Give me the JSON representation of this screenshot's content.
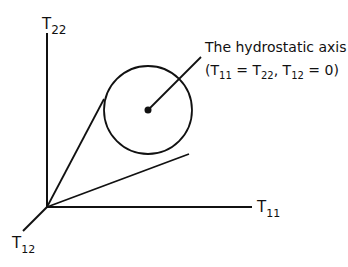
{
  "diagram": {
    "axes": {
      "t22": {
        "base": "T",
        "sub": "22"
      },
      "t11": {
        "base": "T",
        "sub": "11"
      },
      "t12": {
        "base": "T",
        "sub": "12"
      }
    },
    "annotation": {
      "title": "The hydrostatic axis",
      "open": "(",
      "t11": {
        "base": "T",
        "sub": "11"
      },
      "eq1": " = ",
      "t22": {
        "base": "T",
        "sub": "22"
      },
      "comma": ", ",
      "t12": {
        "base": "T",
        "sub": "12"
      },
      "eq2": " = 0)"
    },
    "colors": {
      "stroke": "#111111",
      "background": "#ffffff"
    }
  }
}
